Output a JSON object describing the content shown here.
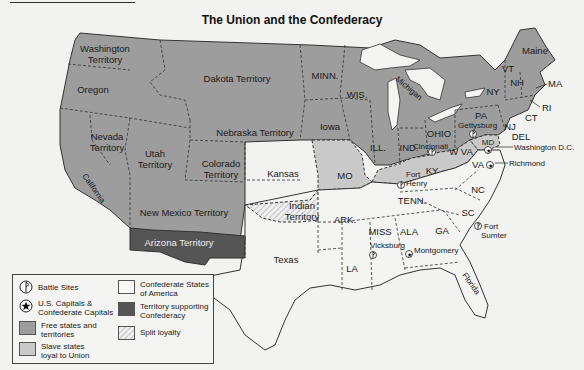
{
  "header": {
    "title": "The Union and the Confederacy"
  },
  "colors": {
    "free": "#9d9d9d",
    "slave_union": "#c9c9c9",
    "confederate": "#f4f4f2",
    "territory_confederacy": "#555555",
    "split": "#e8e8e8",
    "border": "#333333",
    "water": "#f4f4f2"
  },
  "regions": {
    "washington": {
      "line1": "Washington",
      "line2": "Territory"
    },
    "oregon": "Oregon",
    "dakota": "Dakota Territory",
    "minn": "MINN.",
    "wis": "WIS.",
    "michigan": "Michigan",
    "nevada": {
      "line1": "Nevada",
      "line2": "Territory"
    },
    "utah": {
      "line1": "Utah",
      "line2": "Territory"
    },
    "nebraska": "Nebraska Territory",
    "iowa": "Iowa",
    "colorado": {
      "line1": "Colorado",
      "line2": "Territory"
    },
    "kansas": "Kansas",
    "california": "California",
    "new_mexico": "New Mexico Territory",
    "arizona": "Arizona Territory",
    "indian": {
      "line1": "Indian",
      "line2": "Territory"
    },
    "texas": "Texas",
    "mo": "MO",
    "ill": "ILL.",
    "ind": "IND.",
    "ohio": "OHIO",
    "ky": "KY",
    "wva": "W VA",
    "pa": "PA",
    "ny": "NY",
    "vt": "VT",
    "nh": "NH",
    "maine": "Maine",
    "ma": "MA",
    "ri": "RI",
    "ct": "CT",
    "nj": "NJ",
    "del": "DEL",
    "md": "MD",
    "va": "VA",
    "nc": "NC",
    "tenn": "TENN.",
    "ark": "ARK.",
    "sc": "SC",
    "miss": "MISS",
    "ala": "ALA",
    "ga": "GA",
    "la": "LA",
    "florida": "Florida"
  },
  "places": {
    "gettysburg": "Gettysburg",
    "cincinnati": "Cincinnati",
    "fort_henry": {
      "line1": "Fort",
      "line2": "Henry"
    },
    "washington_dc": "Washington D.C.",
    "richmond": "Richmond",
    "fort_sumter": {
      "line1": "Fort",
      "line2": "Sumter"
    },
    "vicksburg": "Vicksburg",
    "montgomery": "Montgomery"
  },
  "legend": {
    "battle_sites": "Battle Sites",
    "capitals": {
      "line1": "U.S. Capitals &",
      "line2": "Confederate Capitals"
    },
    "free": {
      "line1": "Free states and",
      "line2": "territories"
    },
    "slave_union": {
      "line1": "Slave states",
      "line2": "loyal to Union"
    },
    "confederate": {
      "line1": "Confederate States",
      "line2": "of America"
    },
    "territory_confederacy": {
      "line1": "Territory supporting",
      "line2": "Confederacy"
    },
    "split": "Split loyalty"
  }
}
